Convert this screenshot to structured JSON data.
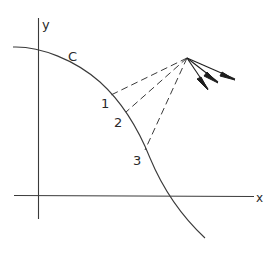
{
  "diagram": {
    "axes": {
      "x_label": "x",
      "y_label": "y"
    },
    "curve": {
      "label": "C"
    },
    "points": [
      {
        "label": "1"
      },
      {
        "label": "2"
      },
      {
        "label": "3"
      }
    ],
    "colors": {
      "line": "#3a3a3a",
      "background": "#ffffff"
    }
  }
}
